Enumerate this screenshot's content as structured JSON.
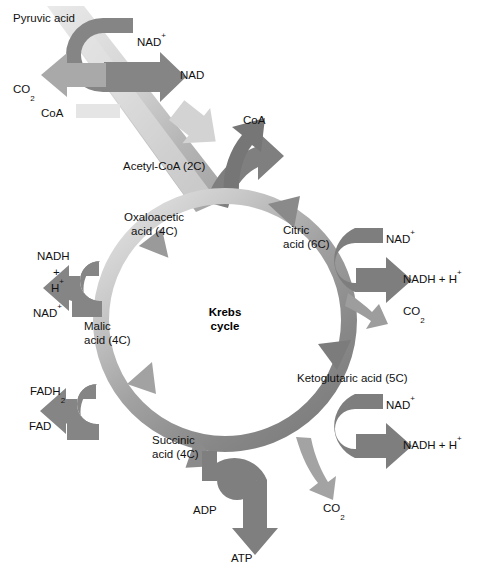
{
  "figure": {
    "center_label_line1": "Krebs",
    "center_label_line2": "cycle"
  },
  "colors": {
    "arrow_dark": "#7b7b7b",
    "arrow_mid": "#8e8e8e",
    "arrow_light": "#c9c9c9",
    "arrow_pale": "#dcdcdc",
    "ring_light": "#d8d8d8",
    "ring_dark": "#808080",
    "text": "#111111",
    "background": "#ffffff"
  },
  "labels": {
    "pyruvic_acid": "Pyruvic acid",
    "nad_plus_top": "NAD",
    "nad_plus_top_sup": "+",
    "nad_top": "NAD",
    "co2_top": "CO",
    "co2_top_sub": "2",
    "coa_left": "CoA",
    "acetyl_coa": "Acetyl-CoA (2C)",
    "coa_top": "CoA",
    "citric_acid_line1": "Citric",
    "citric_acid_line2": "acid (6C)",
    "nad_plus_citric": "NAD",
    "nad_plus_citric_sup": "+",
    "nadh_h_citric": "NADH + H",
    "nadh_h_citric_sup": "+",
    "co2_citric": "CO",
    "co2_citric_sub": "2",
    "ketoglutaric_acid": "Ketoglutaric acid (5C)",
    "nad_plus_keto": "NAD",
    "nad_plus_keto_sup": "+",
    "nadh_h_keto": "NADH + H",
    "nadh_h_keto_sup": "+",
    "co2_keto": "CO",
    "co2_keto_sub": "2",
    "succinic_acid_line1": "Succinic",
    "succinic_acid_line2": "acid (4C)",
    "adp": "ADP",
    "atp": "ATP",
    "fadh2": "FADH",
    "fadh2_sub": "2",
    "fad": "FAD",
    "malic_acid_line1": "Malic",
    "malic_acid_line2": "acid (4C)",
    "nadh_left_line1": "NADH",
    "nadh_left_line2": "+",
    "nadh_left_line3": "H",
    "nadh_left_line3_sup": "+",
    "nad_plus_left": "NAD",
    "nad_plus_left_sup": "+",
    "oxaloacetic_acid_line1": "Oxaloacetic",
    "oxaloacetic_acid_line2": "acid (4C)"
  },
  "cycle": {
    "center_x": 225,
    "center_y": 320,
    "outer_radius": 132,
    "inner_radius": 116,
    "intermediates": [
      {
        "name": "Citric acid",
        "carbons": "6C"
      },
      {
        "name": "Ketoglutaric acid",
        "carbons": "5C"
      },
      {
        "name": "Succinic acid",
        "carbons": "4C"
      },
      {
        "name": "Malic acid",
        "carbons": "4C"
      },
      {
        "name": "Oxaloacetic acid",
        "carbons": "4C"
      }
    ]
  }
}
